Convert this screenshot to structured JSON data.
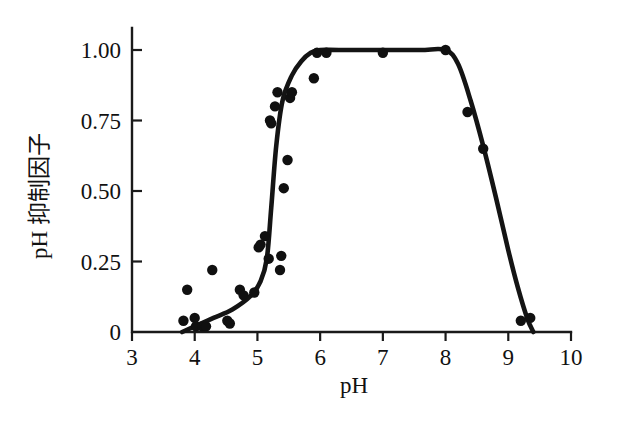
{
  "chart_data": {
    "type": "scatter",
    "title": "",
    "subtitle": "",
    "xlabel": "pH",
    "ylabel": "pH 抑制因子",
    "xlim": [
      3,
      10
    ],
    "ylim": [
      0,
      1.08
    ],
    "grid": false,
    "legend": null,
    "xticks": [
      3,
      4,
      5,
      6,
      7,
      8,
      9,
      10
    ],
    "xtick_labels": [
      "3",
      "4",
      "5",
      "6",
      "7",
      "8",
      "9",
      "10"
    ],
    "yticks": [
      0,
      0.25,
      0.5,
      0.75,
      1.0
    ],
    "ytick_labels": [
      "0",
      "0.25",
      "0.50",
      "0.75",
      "1.00"
    ],
    "series": [
      {
        "name": "measured-points",
        "marker": "filled-circle",
        "color": "#101010",
        "x": [
          3.82,
          3.88,
          4.0,
          4.02,
          4.12,
          4.18,
          4.28,
          4.52,
          4.56,
          4.72,
          4.78,
          4.95,
          5.02,
          5.05,
          5.12,
          5.18,
          5.2,
          5.22,
          5.28,
          5.32,
          5.36,
          5.38,
          5.42,
          5.48,
          5.52,
          5.55,
          5.9,
          5.95,
          6.1,
          7.0,
          8.0,
          8.35,
          8.6,
          9.2,
          9.35
        ],
        "y": [
          0.04,
          0.15,
          0.05,
          0.02,
          0.02,
          0.02,
          0.22,
          0.04,
          0.03,
          0.15,
          0.13,
          0.14,
          0.3,
          0.31,
          0.34,
          0.26,
          0.75,
          0.74,
          0.8,
          0.85,
          0.22,
          0.27,
          0.51,
          0.61,
          0.83,
          0.85,
          0.9,
          0.99,
          0.99,
          0.99,
          1.0,
          0.78,
          0.65,
          0.04,
          0.05
        ]
      },
      {
        "name": "fitted-curve",
        "marker": "none",
        "color": "#141414",
        "x": [
          3.8,
          4.0,
          4.3,
          4.6,
          4.9,
          5.05,
          5.15,
          5.22,
          5.3,
          5.4,
          5.55,
          5.7,
          5.85,
          6.0,
          6.3,
          7.0,
          7.6,
          8.0,
          8.2,
          8.4,
          8.6,
          8.8,
          9.0,
          9.15,
          9.3,
          9.4
        ],
        "y": [
          0.0,
          0.02,
          0.05,
          0.08,
          0.13,
          0.18,
          0.26,
          0.44,
          0.66,
          0.82,
          0.91,
          0.96,
          0.99,
          1.0,
          1.0,
          1.0,
          1.0,
          1.0,
          0.95,
          0.82,
          0.66,
          0.48,
          0.29,
          0.16,
          0.05,
          0.0
        ]
      }
    ]
  },
  "axes": {
    "x_title": "pH",
    "y_title": "pH 抑制因子"
  }
}
